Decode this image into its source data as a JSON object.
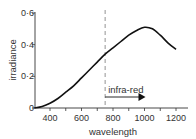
{
  "chart_data": {
    "type": "line",
    "title": "",
    "xlabel": "wavelength",
    "ylabel": "irradiance",
    "xlim": [
      300,
      1250
    ],
    "ylim": [
      0,
      0.6
    ],
    "x_ticks": [
      400,
      600,
      800,
      1000,
      1200
    ],
    "x_tick_labels": [
      "400",
      "600",
      "800",
      "1000",
      "1200"
    ],
    "y_ticks": [
      0,
      0.2,
      0.4,
      0.6
    ],
    "y_tick_labels": [
      "0",
      "0·2",
      "0·4",
      "0·6"
    ],
    "grid": false,
    "legend": null,
    "series": [
      {
        "name": "irradiance",
        "x": [
          300,
          350,
          400,
          450,
          500,
          550,
          600,
          650,
          700,
          750,
          800,
          850,
          900,
          950,
          1000,
          1050,
          1100,
          1150,
          1200
        ],
        "y": [
          0.0,
          0.01,
          0.03,
          0.06,
          0.1,
          0.14,
          0.19,
          0.24,
          0.29,
          0.34,
          0.38,
          0.42,
          0.46,
          0.49,
          0.51,
          0.5,
          0.46,
          0.41,
          0.37
        ]
      }
    ],
    "annotations": [
      {
        "type": "vline",
        "x": 750,
        "style": "dashed"
      },
      {
        "type": "arrow",
        "text": "infra-red",
        "from_x": 750,
        "to_x": 1000,
        "y": 0.1
      }
    ]
  }
}
